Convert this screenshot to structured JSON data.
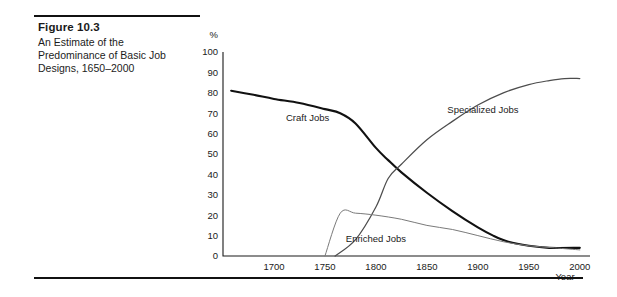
{
  "caption": {
    "title": "Figure 10.3",
    "body": "An Estimate of the Predominance of Basic Job Designs, 1650–2000"
  },
  "chart_data": {
    "type": "line",
    "title": "An Estimate of the Predominance of Basic Job Designs, 1650–2000",
    "xlabel": "Year",
    "ylabel": "%",
    "xlim": [
      1650,
      2010
    ],
    "ylim": [
      0,
      100
    ],
    "grid": false,
    "legend": "inline-annotations",
    "x_ticks": [
      "1700",
      "1750",
      "1800",
      "1850",
      "1900",
      "1950",
      "2000"
    ],
    "y_ticks": [
      "0",
      "10",
      "20",
      "30",
      "40",
      "50",
      "60",
      "70",
      "80",
      "90",
      "100"
    ],
    "y_unit": "%",
    "series": [
      {
        "name": "Craft Jobs",
        "color": "#111111",
        "label_x": 1733,
        "label_y": 66,
        "x": [
          1658,
          1680,
          1700,
          1725,
          1750,
          1765,
          1780,
          1800,
          1812,
          1825,
          1850,
          1875,
          1900,
          1915,
          1930,
          1950,
          1970,
          2000
        ],
        "y": [
          81,
          79,
          77,
          75,
          72,
          70,
          65,
          53,
          47,
          41,
          31,
          22,
          14,
          10,
          7,
          5,
          4,
          4
        ]
      },
      {
        "name": "Specialized Jobs",
        "color": "#4d4d4d",
        "label_x": 1905,
        "label_y": 70,
        "x": [
          1760,
          1780,
          1800,
          1812,
          1825,
          1850,
          1875,
          1900,
          1925,
          1950,
          1970,
          1985,
          2000
        ],
        "y": [
          0,
          8,
          24,
          38,
          45,
          57,
          66,
          74,
          80,
          84,
          86,
          87,
          87
        ]
      },
      {
        "name": "Enriched Jobs",
        "color": "#7a7a7a",
        "label_x": 1800,
        "label_y": 7,
        "x": [
          1750,
          1765,
          1780,
          1800,
          1825,
          1850,
          1875,
          1900,
          1925,
          1950,
          1975,
          2000
        ],
        "y": [
          0,
          21,
          21,
          20,
          18,
          15,
          13,
          10,
          7,
          5,
          4,
          3
        ]
      }
    ]
  }
}
